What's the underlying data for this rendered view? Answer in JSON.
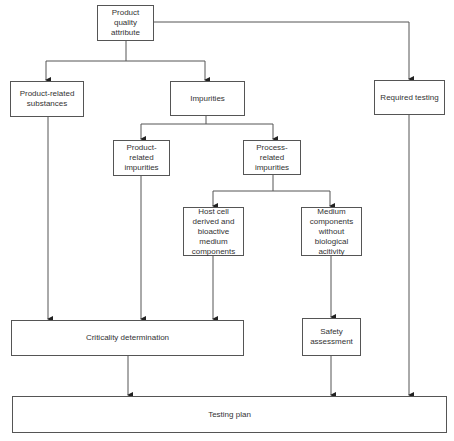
{
  "diagram": {
    "nodes": {
      "pqa": "Product quality attribute",
      "prs": "Product-related substances",
      "imp": "Impurities",
      "req": "Required testing",
      "pri": "Product-related impurities",
      "proc": "Process-related impurities",
      "host": "Host cell derived and bioactive medium components",
      "medium": "Medium components without biological acitivity",
      "crit": "Criticality determination",
      "safety": "Safety assessment",
      "plan": "Testing plan"
    },
    "edges": [
      {
        "from": "pqa",
        "to": "prs"
      },
      {
        "from": "pqa",
        "to": "imp"
      },
      {
        "from": "pqa",
        "to": "req"
      },
      {
        "from": "imp",
        "to": "pri"
      },
      {
        "from": "imp",
        "to": "proc"
      },
      {
        "from": "proc",
        "to": "host"
      },
      {
        "from": "proc",
        "to": "medium"
      },
      {
        "from": "prs",
        "to": "crit"
      },
      {
        "from": "pri",
        "to": "crit"
      },
      {
        "from": "host",
        "to": "crit"
      },
      {
        "from": "medium",
        "to": "safety"
      },
      {
        "from": "crit",
        "to": "plan"
      },
      {
        "from": "safety",
        "to": "plan"
      },
      {
        "from": "req",
        "to": "plan"
      }
    ]
  }
}
